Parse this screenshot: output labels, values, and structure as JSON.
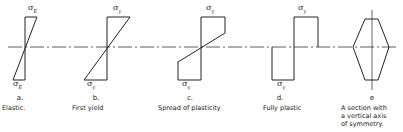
{
  "figure": {
    "neutral_axis_y": 47,
    "panels": [
      {
        "id": "a",
        "letter": "a.",
        "caption": "Elastic.",
        "stress_top": "σ",
        "stress_top_sub": "E",
        "stress_bottom": "σ",
        "stress_bottom_sub": "E"
      },
      {
        "id": "b",
        "letter": "b.",
        "caption": "First yield",
        "stress_top": "σ",
        "stress_top_sub": "y",
        "stress_bottom": "σ",
        "stress_bottom_sub": "y"
      },
      {
        "id": "c",
        "letter": "c.",
        "caption": "Spread of plasticity",
        "stress_top": "σ",
        "stress_top_sub": "y",
        "stress_bottom": "σ",
        "stress_bottom_sub": "y"
      },
      {
        "id": "d",
        "letter": "d.",
        "caption": "Fully plastic",
        "stress_top": "σ",
        "stress_top_sub": "y",
        "stress_bottom": "σ",
        "stress_bottom_sub": "y"
      },
      {
        "id": "e",
        "letter": "e",
        "caption_lines": [
          "A section with",
          "a vertical axis",
          "of symmetry."
        ]
      }
    ]
  }
}
